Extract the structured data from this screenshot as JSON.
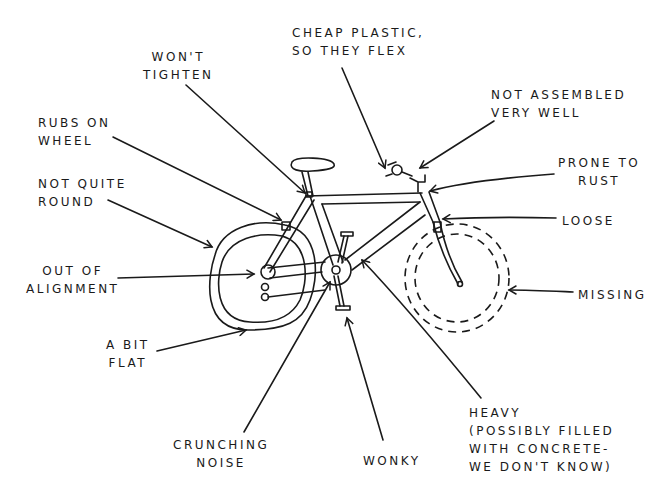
{
  "diagram": {
    "labels": [
      {
        "id": "wont-tighten",
        "text": "WON'T\nTIGHTEN",
        "target": "seat clamp"
      },
      {
        "id": "cheap-plastic",
        "text": "CHEAP PLASTIC,\nSO THEY FLEX",
        "target": "brake levers"
      },
      {
        "id": "not-assembled",
        "text": "NOT ASSEMBLED\nVERY WELL",
        "target": "handlebar stem"
      },
      {
        "id": "rubs-on-wheel",
        "text": "RUBS ON\nWHEEL",
        "target": "rear brake"
      },
      {
        "id": "prone-to-rust",
        "text": "PRONE TO\nRUST",
        "target": "head tube"
      },
      {
        "id": "not-quite-round",
        "text": "NOT QUITE\nROUND",
        "target": "rear wheel"
      },
      {
        "id": "loose",
        "text": "LOOSE",
        "target": "front brake"
      },
      {
        "id": "out-of-alignment",
        "text": "OUT OF\nALIGNMENT",
        "target": "rear hub"
      },
      {
        "id": "missing",
        "text": "MISSING",
        "target": "front wheel"
      },
      {
        "id": "a-bit-flat",
        "text": "A BIT\nFLAT",
        "target": "rear tire"
      },
      {
        "id": "heavy",
        "text": "HEAVY\n(POSSIBLY FILLED\nWITH CONCRETE-\nWE DON'T KNOW)",
        "target": "down tube"
      },
      {
        "id": "crunching-noise",
        "text": "CRUNCHING\nNOISE",
        "target": "chainring"
      },
      {
        "id": "wonky",
        "text": "WONKY",
        "target": "pedal"
      }
    ]
  }
}
